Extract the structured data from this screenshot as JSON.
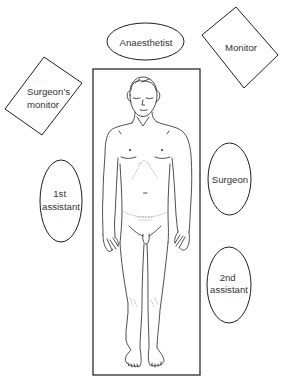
{
  "diagram": {
    "colors": {
      "background": "#ffffff",
      "stroke": "#1e1e1e",
      "text": "#333333",
      "faint_marks": "#9a9a9a"
    },
    "stations": {
      "anaesthetist": {
        "shape": "ellipse",
        "lines": [
          "Anaesthetist"
        ]
      },
      "monitor": {
        "shape": "rotated-rectangle",
        "lines": [
          "Monitor"
        ]
      },
      "surgeons_monitor": {
        "shape": "rotated-rectangle",
        "lines": [
          "Surgeon’s",
          "monitor"
        ]
      },
      "first_assistant": {
        "shape": "ellipse",
        "lines": [
          "1st",
          "assistant"
        ]
      },
      "surgeon": {
        "shape": "ellipse",
        "lines": [
          "Surgeon"
        ]
      },
      "second_assistant": {
        "shape": "ellipse",
        "lines": [
          "2nd",
          "assistant"
        ]
      }
    },
    "operating_table": {
      "shape": "rectangle",
      "icon": "supine-patient-figure"
    }
  }
}
